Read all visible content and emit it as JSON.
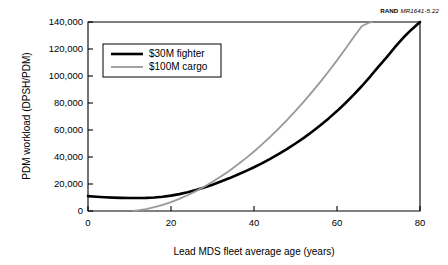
{
  "credit": {
    "mark": "RAND",
    "id": "MR1641-5.22"
  },
  "chart_data": {
    "type": "line",
    "title": "",
    "xlabel": "Lead MDS fleet average age (years)",
    "ylabel": "PDM workload (DPSH/PDM)",
    "xlim": [
      0,
      80
    ],
    "ylim": [
      0,
      140000
    ],
    "xticks": [
      0,
      20,
      40,
      60,
      80
    ],
    "xticklabels": [
      "0",
      "20",
      "40",
      "60",
      "80"
    ],
    "yticks": [
      0,
      20000,
      40000,
      60000,
      80000,
      100000,
      120000,
      140000
    ],
    "yticklabels": [
      "0",
      "20,000",
      "40,000",
      "60,000",
      "80,000",
      "100,000",
      "120,000",
      "140,000"
    ],
    "grid": false,
    "legend_position": "upper left",
    "series": [
      {
        "name": "$30M fighter",
        "color": "#000000",
        "linewidth": 2.6,
        "x": [
          0,
          2,
          4,
          6,
          8,
          10,
          12,
          14,
          16,
          18,
          20,
          22,
          24,
          26,
          28,
          30,
          32,
          34,
          36,
          38,
          40,
          42,
          44,
          46,
          48,
          50,
          52,
          54,
          56,
          58,
          60,
          62,
          64,
          66,
          68,
          70,
          72,
          74,
          76,
          78,
          80
        ],
        "y": [
          11000,
          10600,
          10200,
          9900,
          9700,
          9600,
          9600,
          9700,
          10000,
          10500,
          11400,
          12500,
          13900,
          15500,
          17400,
          19500,
          21800,
          24200,
          26800,
          29500,
          32400,
          35500,
          38800,
          42300,
          46000,
          50000,
          54200,
          58700,
          63500,
          68600,
          74000,
          79800,
          86000,
          92600,
          99600,
          107000,
          114000,
          121500,
          128500,
          134500,
          140000
        ]
      },
      {
        "name": "$100M cargo",
        "color": "#999999",
        "linewidth": 1.8,
        "x": [
          11,
          12,
          14,
          16,
          18,
          20,
          22,
          24,
          26,
          28,
          30,
          32,
          34,
          36,
          38,
          40,
          42,
          44,
          46,
          48,
          50,
          52,
          54,
          56,
          58,
          60,
          62,
          64,
          66,
          68,
          68.5
        ],
        "y": [
          0,
          400,
          1400,
          2800,
          4500,
          6600,
          9000,
          11700,
          14700,
          18000,
          21600,
          25500,
          29700,
          34200,
          39000,
          44100,
          49500,
          55200,
          61200,
          67500,
          74100,
          81000,
          88200,
          95700,
          103500,
          111600,
          120000,
          128700,
          137000,
          139800,
          140000
        ]
      }
    ],
    "legend": [
      {
        "label": "$30M fighter",
        "color": "#000000"
      },
      {
        "label": "$100M cargo",
        "color": "#999999"
      }
    ]
  }
}
